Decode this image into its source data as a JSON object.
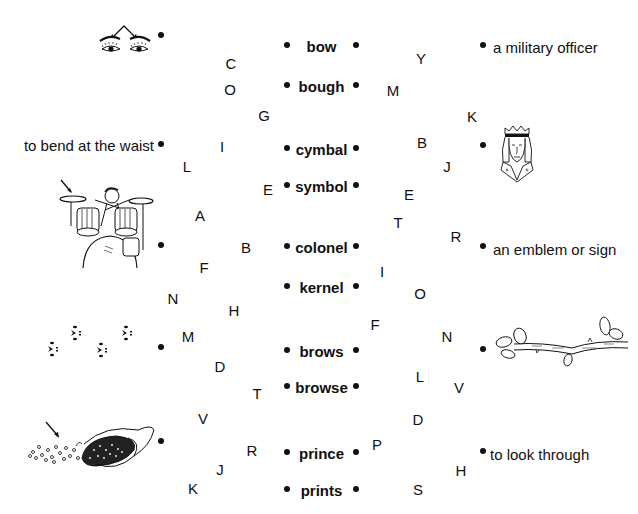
{
  "worksheet": {
    "left_items": [
      {
        "type": "picture",
        "label": "eyebrows-picture",
        "dot": [
          161,
          35
        ]
      },
      {
        "type": "text",
        "text": "to bend at the waist",
        "dot": [
          161,
          144
        ]
      },
      {
        "type": "picture",
        "label": "drummer-cymbal-picture",
        "dot": [
          161,
          245
        ]
      },
      {
        "type": "picture",
        "label": "paw-prints-picture",
        "dot": [
          161,
          347
        ]
      },
      {
        "type": "picture",
        "label": "corn-kernel-picture",
        "dot": [
          161,
          441
        ]
      }
    ],
    "center_words": [
      {
        "text": "bow",
        "y": 45
      },
      {
        "text": "bough",
        "y": 85
      },
      {
        "text": "cymbal",
        "y": 148
      },
      {
        "text": "symbol",
        "y": 185
      },
      {
        "text": "colonel",
        "y": 246
      },
      {
        "text": "kernel",
        "y": 286
      },
      {
        "text": "brows",
        "y": 350
      },
      {
        "text": "browse",
        "y": 386
      },
      {
        "text": "prince",
        "y": 452
      },
      {
        "text": "prints",
        "y": 489
      }
    ],
    "right_items": [
      {
        "type": "text",
        "text": "a military officer",
        "dot": [
          483,
          45
        ]
      },
      {
        "type": "picture",
        "label": "prince-picture",
        "dot": [
          483,
          145
        ]
      },
      {
        "type": "text",
        "text": "an emblem or sign",
        "dot": [
          483,
          246
        ]
      },
      {
        "type": "picture",
        "label": "tree-branch-picture",
        "dot": [
          483,
          349
        ]
      },
      {
        "type": "text",
        "text": "to look through",
        "dot": [
          483,
          451
        ]
      }
    ],
    "left_letters": [
      {
        "ch": "C",
        "x": 231,
        "y": 63
      },
      {
        "ch": "O",
        "x": 230,
        "y": 89
      },
      {
        "ch": "G",
        "x": 264,
        "y": 115
      },
      {
        "ch": "I",
        "x": 222,
        "y": 146
      },
      {
        "ch": "L",
        "x": 187,
        "y": 166
      },
      {
        "ch": "E",
        "x": 268,
        "y": 189
      },
      {
        "ch": "A",
        "x": 200,
        "y": 215
      },
      {
        "ch": "B",
        "x": 246,
        "y": 247
      },
      {
        "ch": "F",
        "x": 204,
        "y": 267
      },
      {
        "ch": "N",
        "x": 173,
        "y": 298
      },
      {
        "ch": "H",
        "x": 234,
        "y": 310
      },
      {
        "ch": "M",
        "x": 188,
        "y": 336
      },
      {
        "ch": "D",
        "x": 220,
        "y": 366
      },
      {
        "ch": "T",
        "x": 257,
        "y": 393
      },
      {
        "ch": "V",
        "x": 203,
        "y": 418
      },
      {
        "ch": "R",
        "x": 252,
        "y": 450
      },
      {
        "ch": "J",
        "x": 220,
        "y": 469
      },
      {
        "ch": "K",
        "x": 193,
        "y": 488
      }
    ],
    "right_letters": [
      {
        "ch": "Y",
        "x": 421,
        "y": 58
      },
      {
        "ch": "M",
        "x": 393,
        "y": 90
      },
      {
        "ch": "K",
        "x": 472,
        "y": 116
      },
      {
        "ch": "B",
        "x": 422,
        "y": 142
      },
      {
        "ch": "J",
        "x": 447,
        "y": 166
      },
      {
        "ch": "E",
        "x": 409,
        "y": 194
      },
      {
        "ch": "T",
        "x": 398,
        "y": 222
      },
      {
        "ch": "R",
        "x": 456,
        "y": 236
      },
      {
        "ch": "I",
        "x": 382,
        "y": 271
      },
      {
        "ch": "O",
        "x": 420,
        "y": 293
      },
      {
        "ch": "F",
        "x": 375,
        "y": 324
      },
      {
        "ch": "N",
        "x": 447,
        "y": 336
      },
      {
        "ch": "L",
        "x": 420,
        "y": 376
      },
      {
        "ch": "V",
        "x": 459,
        "y": 387
      },
      {
        "ch": "D",
        "x": 418,
        "y": 419
      },
      {
        "ch": "P",
        "x": 377,
        "y": 444
      },
      {
        "ch": "H",
        "x": 461,
        "y": 470
      },
      {
        "ch": "S",
        "x": 418,
        "y": 489
      }
    ],
    "center_dot_x": {
      "left": 287,
      "right": 356
    },
    "ink_color": "#111111"
  }
}
